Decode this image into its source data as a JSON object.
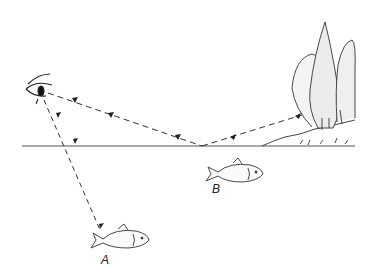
{
  "figure": {
    "labels": {
      "fish_a": "A",
      "fish_b": "B"
    },
    "colors": {
      "line": "#333333",
      "water_line": "#555555",
      "tree_stipple": "#777777",
      "background": "#ffffff"
    },
    "elements": [
      "eye-icon",
      "water-surface-line",
      "ray-to-fish-a",
      "reflected-ray-from-trees",
      "trees-on-bank",
      "fish-a",
      "fish-b"
    ]
  }
}
